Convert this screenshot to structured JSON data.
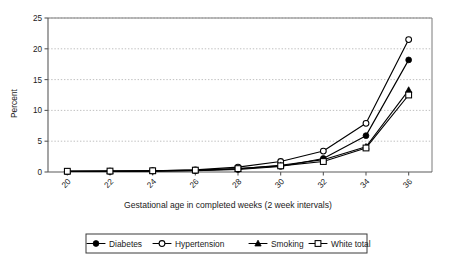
{
  "chart_data": {
    "type": "line",
    "title": "",
    "xlabel": "Gestational age in completed weeks (2 week intervals)",
    "ylabel": "Percent",
    "categories": [
      20,
      22,
      24,
      26,
      28,
      30,
      32,
      34,
      36
    ],
    "x_tick_labels": [
      "20",
      "22",
      "24",
      "26",
      "28",
      "30",
      "32",
      "34",
      "36"
    ],
    "y_tick_labels": [
      "0",
      "5",
      "10",
      "15",
      "20",
      "25"
    ],
    "y_ticks": [
      0,
      5,
      10,
      15,
      20,
      25
    ],
    "ylim": [
      0,
      25
    ],
    "grid": "horizontal-dotted",
    "legend_position": "bottom",
    "series": [
      {
        "name": "Diabetes",
        "marker": "filled-circle",
        "values": [
          0.1,
          0.1,
          0.15,
          0.2,
          0.4,
          0.9,
          2.2,
          5.9,
          18.2
        ]
      },
      {
        "name": "Hypertension",
        "marker": "open-circle",
        "values": [
          0.1,
          0.15,
          0.2,
          0.35,
          0.8,
          1.7,
          3.4,
          7.9,
          21.5
        ]
      },
      {
        "name": "Smoking",
        "marker": "filled-triangle",
        "values": [
          0.1,
          0.12,
          0.15,
          0.25,
          0.5,
          1.1,
          2.0,
          4.1,
          13.3
        ]
      },
      {
        "name": "White total",
        "marker": "open-square",
        "values": [
          0.12,
          0.15,
          0.2,
          0.3,
          0.55,
          1.0,
          1.7,
          3.9,
          12.5
        ]
      }
    ]
  },
  "legend": {
    "entries": [
      {
        "label": "Diabetes",
        "marker": "filled-circle"
      },
      {
        "label": "Hypertension",
        "marker": "open-circle"
      },
      {
        "label": "Smoking",
        "marker": "filled-triangle"
      },
      {
        "label": "White total",
        "marker": "open-square"
      }
    ]
  },
  "axes": {
    "y_axis_title": "Percent",
    "x_axis_title": "Gestational age in completed weeks (2 week intervals)"
  },
  "colors": {
    "series_stroke": "#000000",
    "grid": "#b9b9b9",
    "axis": "#5a5a5a",
    "background": "#ffffff"
  }
}
